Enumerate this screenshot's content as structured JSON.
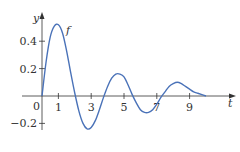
{
  "chart_data": {
    "type": "line",
    "title": "",
    "xlabel": "t",
    "ylabel": "y",
    "curve_label": "f",
    "origin_label": "0",
    "xlim": [
      0,
      10
    ],
    "ylim": [
      -0.3,
      0.55
    ],
    "x_ticks": [
      1,
      3,
      5,
      7,
      9
    ],
    "x_tick_labels": [
      "1",
      "3",
      "5",
      "7",
      "9"
    ],
    "y_ticks": [
      0.4,
      0.2,
      -0.2
    ],
    "y_tick_labels": [
      "0.4",
      "0.2",
      "−0.2"
    ],
    "grid": false,
    "series": [
      {
        "name": "f",
        "color": "#4a72b8",
        "x": [
          0,
          0.25,
          0.5,
          0.75,
          1.0,
          1.25,
          1.5,
          1.75,
          2.0,
          2.25,
          2.5,
          2.75,
          3.0,
          3.25,
          3.5,
          3.75,
          4.0,
          4.25,
          4.5,
          4.75,
          5.0,
          5.25,
          5.5,
          5.75,
          6.0,
          6.25,
          6.5,
          6.75,
          7.0,
          7.25,
          7.5,
          7.75,
          8.0,
          8.25,
          8.5,
          8.75,
          9.0,
          9.25,
          9.5,
          9.75,
          10.0
        ],
        "values": [
          0,
          0.25,
          0.43,
          0.51,
          0.52,
          0.46,
          0.33,
          0.17,
          0.02,
          -0.11,
          -0.2,
          -0.24,
          -0.23,
          -0.18,
          -0.1,
          -0.01,
          0.07,
          0.13,
          0.16,
          0.16,
          0.14,
          0.08,
          0.01,
          -0.05,
          -0.1,
          -0.12,
          -0.12,
          -0.1,
          -0.06,
          -0.01,
          0.03,
          0.07,
          0.09,
          0.1,
          0.09,
          0.07,
          0.05,
          0.03,
          0.02,
          0.01,
          0.0
        ]
      }
    ]
  }
}
